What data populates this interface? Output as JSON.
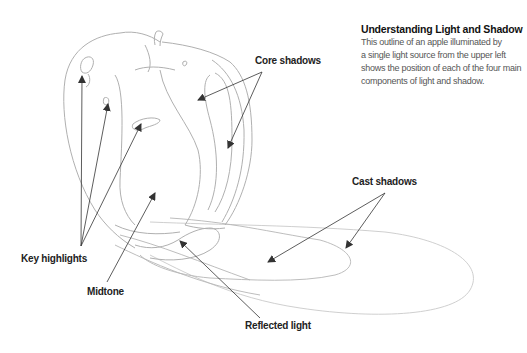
{
  "caption": {
    "title": "Understanding Light and Shadow",
    "lines": [
      "This outline of an apple illuminated by",
      "a single light source from the upper left",
      "shows the position of each of the four main",
      "components of light and shadow."
    ]
  },
  "labels": {
    "core_shadows": "Core shadows",
    "cast_shadows": "Cast shadows",
    "key_highlights": "Key highlights",
    "midtone": "Midtone",
    "reflected_light": "Reflected light"
  },
  "colors": {
    "sketch_line": "#b8b8b8",
    "arrow": "#333333",
    "label_text": "#222222",
    "body_text": "#555555",
    "background": "#ffffff"
  }
}
